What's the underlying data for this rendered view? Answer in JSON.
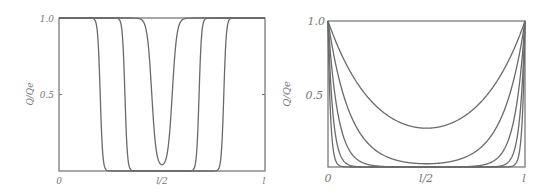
{
  "chart_data": [
    {
      "type": "line",
      "title": "",
      "xlabel": "",
      "ylabel": "Q/Qe",
      "xlim": [
        0,
        1
      ],
      "ylim": [
        0,
        1.0
      ],
      "x_ticks": [
        "0",
        "l/2",
        "l"
      ],
      "y_ticks": [
        "0.5",
        "1.0"
      ],
      "grid": false,
      "legend": null,
      "series": [
        {
          "name": "curve-1",
          "shape": "plateau-with-dip",
          "front_left": 0.2,
          "front_right": 0.8,
          "min": 0.0
        },
        {
          "name": "curve-2",
          "shape": "plateau-with-dip",
          "front_left": 0.32,
          "front_right": 0.68,
          "min": 0.0
        },
        {
          "name": "curve-3",
          "shape": "v-dip",
          "front_left": 0.45,
          "front_right": 0.55,
          "min": 0.02
        }
      ]
    },
    {
      "type": "line",
      "title": "",
      "xlabel": "",
      "ylabel": "Q/Qe",
      "xlim": [
        0,
        1
      ],
      "ylim": [
        0,
        1.0
      ],
      "x_ticks": [
        "0",
        "l/2",
        "l"
      ],
      "y_ticks": [
        "0.5",
        "1.0"
      ],
      "grid": false,
      "legend": null,
      "series": [
        {
          "name": "curve-1",
          "shape": "cosh",
          "k": 4,
          "min_at_center": 0.27
        },
        {
          "name": "curve-2",
          "shape": "cosh",
          "k": 9,
          "min_at_center": 0.02
        },
        {
          "name": "curve-3",
          "shape": "cosh",
          "k": 20,
          "min_at_center": 0.0
        },
        {
          "name": "curve-4",
          "shape": "cosh",
          "k": 40,
          "min_at_center": 0.0
        },
        {
          "name": "curve-5",
          "shape": "cosh",
          "k": 80,
          "min_at_center": 0.0
        }
      ]
    }
  ],
  "left": {
    "ylabel": "Q/Qe",
    "y_tick_top": "1.0",
    "y_tick_mid": "0.5",
    "x_tick_left": "0",
    "x_tick_mid": "l/2",
    "x_tick_right": "l"
  },
  "right": {
    "ylabel": "Q/Qe",
    "y_tick_top": "1.0",
    "y_tick_mid": "0.5",
    "x_tick_left": "0",
    "x_tick_mid": "l/2",
    "x_tick_right": "l"
  },
  "colors": {
    "line": "#6a6a6a",
    "frame": "#7a7a7a",
    "text": "#777777"
  }
}
